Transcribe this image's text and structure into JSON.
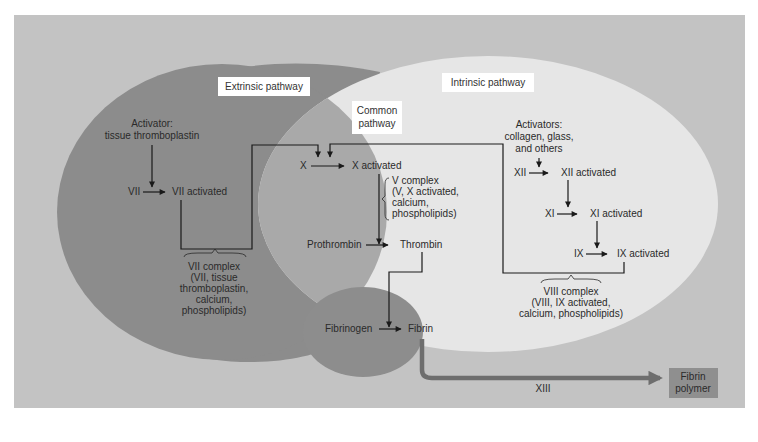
{
  "colors": {
    "panel_bg": "#c3c3c3",
    "extrinsic": "#8c8c8c",
    "intrinsic": "#e6e6e6",
    "common": "#a9a9a9",
    "fibrin_circle": "#8d8d8d",
    "xiii_arrow": "#6e6e6e",
    "fibrin_polymer_box": "#8f8f8f",
    "label_box": "#ffffff",
    "line": "#1a1a1a"
  },
  "pathways": {
    "extrinsic_label": "Extrinsic pathway",
    "intrinsic_label": "Intrinsic pathway",
    "common_label_line1": "Common",
    "common_label_line2": "pathway"
  },
  "extrinsic": {
    "activator_line1": "Activator:",
    "activator_line2": "tissue thromboplastin",
    "factor": "VII",
    "factor_activated": "VII activated",
    "complex_lines": [
      "VII complex",
      "(VII, tissue",
      "thromboplastin,",
      "calcium,",
      "phospholipids)"
    ]
  },
  "intrinsic": {
    "activators_lines": [
      "Activators:",
      "collagen, glass,",
      "and others"
    ],
    "steps": [
      {
        "factor": "XII",
        "activated": "XII activated"
      },
      {
        "factor": "XI",
        "activated": "XI activated"
      },
      {
        "factor": "IX",
        "activated": "IX activated"
      }
    ],
    "complex_lines": [
      "VIII complex",
      "(VIII, IX activated,",
      "calcium, phospholipids)"
    ]
  },
  "common": {
    "factor": "X",
    "factor_activated": "X activated",
    "complex_lines": [
      "V complex",
      "(V, X activated,",
      "calcium,",
      "phospholipids)"
    ],
    "prothrombin": "Prothrombin",
    "thrombin": "Thrombin",
    "fibrinogen": "Fibrinogen",
    "fibrin": "Fibrin"
  },
  "final": {
    "enzyme": "XIII",
    "product_line1": "Fibrin",
    "product_line2": "polymer"
  }
}
